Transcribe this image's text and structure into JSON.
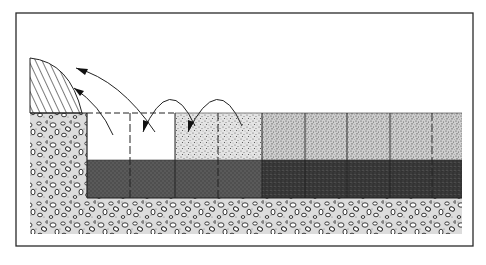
{
  "diagram": {
    "type": "cross-section illustration",
    "colors": {
      "frame": "#2a2a2a",
      "gravel_bg": "#d8d8d8",
      "fine_fill": "#c9c9c9",
      "dark_layer": "#4a4a4a",
      "darker_layer": "#2e2e2e",
      "open_trench": "#ffffff",
      "hatch": "#333333"
    },
    "regions": [
      {
        "name": "spoil-pile",
        "pattern": "diagonal hatch"
      },
      {
        "name": "native-ground",
        "pattern": "gravel / pebbles"
      },
      {
        "name": "open-trench",
        "pattern": "empty"
      },
      {
        "name": "backfill-upper",
        "pattern": "fine stipple"
      },
      {
        "name": "lower-layer-left",
        "pattern": "medium grey"
      },
      {
        "name": "lower-layer-right",
        "pattern": "dark grey"
      }
    ],
    "sections_x": [
      87,
      130,
      175,
      218,
      262,
      305,
      347,
      390,
      432,
      462
    ],
    "dashed_dividers": [
      130,
      218,
      432
    ],
    "arrows": [
      {
        "name": "cast-to-spoil-upper"
      },
      {
        "name": "cast-to-spoil-lower"
      },
      {
        "name": "transfer-arc-1"
      },
      {
        "name": "transfer-arc-2"
      }
    ]
  }
}
